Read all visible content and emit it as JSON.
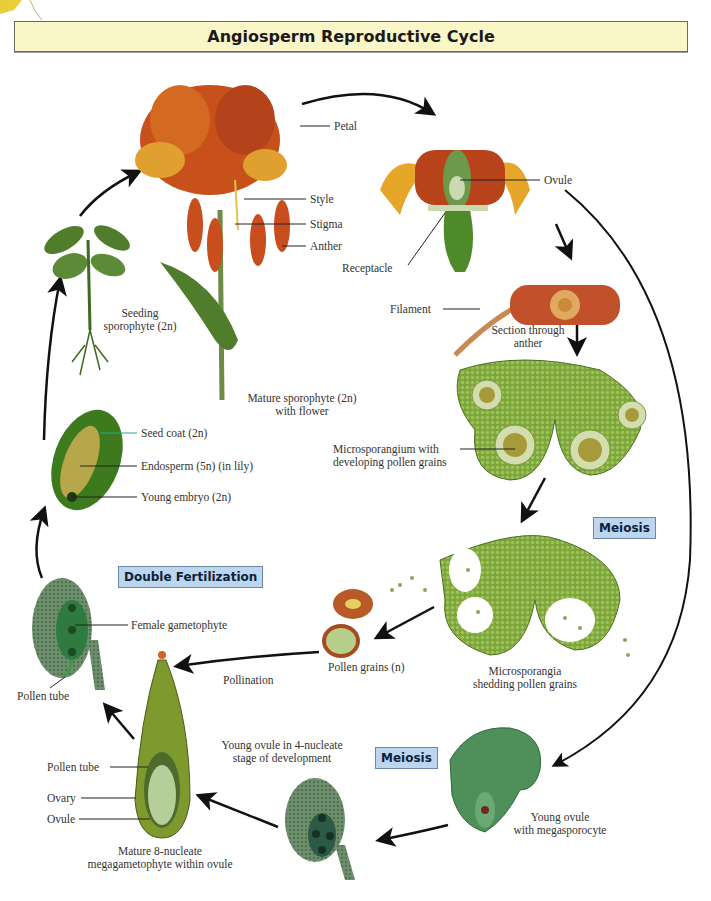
{
  "title": "Angiosperm Reproductive Cycle",
  "colors": {
    "title_bg": "#fbf6c8",
    "process_box_bg": "#bcd6ef",
    "arrow": "#111111",
    "plant_green": "#4f8a2a",
    "petal_orange": "#c8501a"
  },
  "process_boxes": {
    "meiosis_micro": "Meiosis",
    "meiosis_mega": "Meiosis",
    "double_fertilization": "Double Fertilization"
  },
  "labels": {
    "petal": "Petal",
    "style": "Style",
    "stigma": "Stigma",
    "anther": "Anther",
    "ovule_flower": "Ovule",
    "receptacle": "Receptacle",
    "filament": "Filament",
    "section_anther_1": "Section through",
    "section_anther_2": "anther",
    "seedling_1": "Seeding",
    "seedling_2": "sporophyte (2n)",
    "mature_1": "Mature sporophyte (2n)",
    "mature_2": "with flower",
    "seed_coat": "Seed coat (2n)",
    "endosperm": "Endosperm (5n) (in lily)",
    "young_embryo": "Young embryo (2n)",
    "microsporangium_1": "Microsporangium with",
    "microsporangium_2": "developing pollen grains",
    "microsporangia_1": "Microsporangia",
    "microsporangia_2": "shedding pollen grains",
    "pollen_grains": "Pollen grains (n)",
    "pollination": "Pollination",
    "female_gametophyte": "Female gametophyte",
    "pollen_tube_top": "Pollen tube",
    "pollen_tube_ovary": "Pollen tube",
    "ovary": "Ovary",
    "ovule_ovary": "Ovule",
    "mature8_1": "Mature 8-nucleate",
    "mature8_2": "megagametophyte within ovule",
    "young4_1": "Young ovule in 4-nucleate",
    "young4_2": "stage of development",
    "megasporocyte_1": "Young ovule",
    "megasporocyte_2": "with megasporocyte"
  }
}
